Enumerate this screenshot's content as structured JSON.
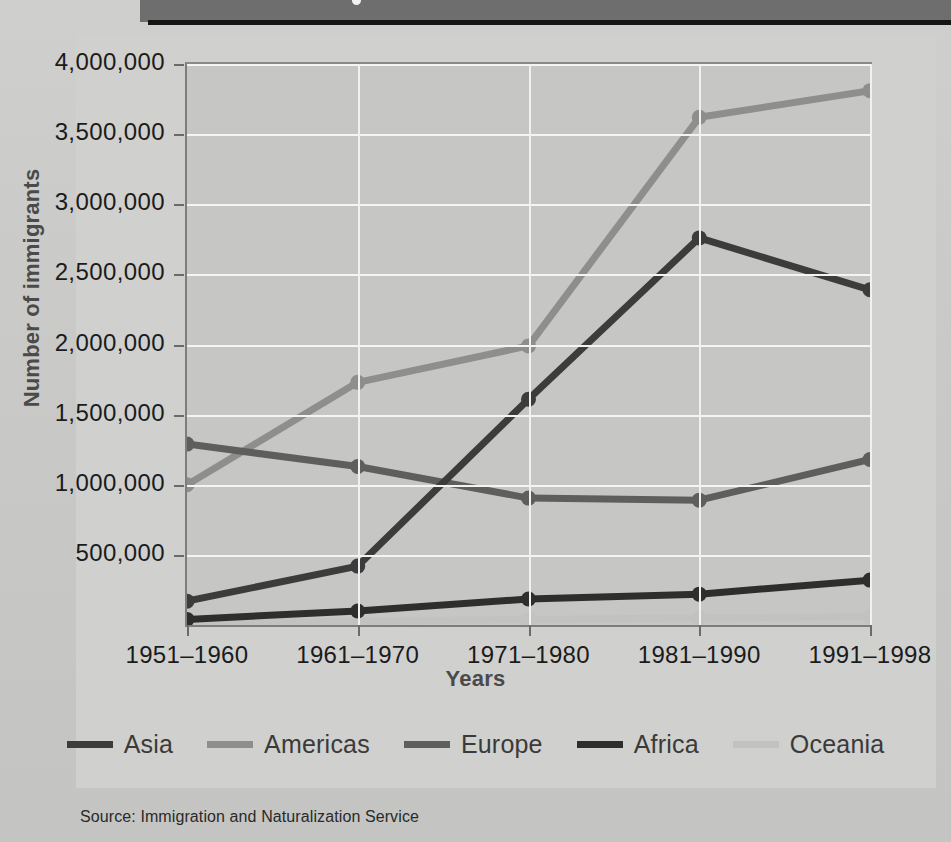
{
  "banner": {
    "title": "",
    "dot_icon": "bullet-dot-icon"
  },
  "axes": {
    "ylabel": "Number of immigrants",
    "xlabel": "Years",
    "yticks": [
      "4,000,000",
      "3,500,000",
      "3,000,000",
      "2,500,000",
      "2,000,000",
      "1,500,000",
      "1,000,000",
      "500,000"
    ],
    "xticks": [
      "1951–1960",
      "1961–1970",
      "1971–1980",
      "1981–1990",
      "1991–1998"
    ]
  },
  "legend": {
    "items": [
      {
        "label": "Asia",
        "color": "#3c3c3c"
      },
      {
        "label": "Americas",
        "color": "#8e8e8c"
      },
      {
        "label": "Europe",
        "color": "#5e5e5c"
      },
      {
        "label": "Africa",
        "color": "#2e2e2e"
      },
      {
        "label": "Oceania",
        "color": "#c2c2c0"
      }
    ]
  },
  "source": {
    "text": "Source:  Immigration and Naturalization Service"
  },
  "colors": {
    "page_background": "#c8c8c6",
    "plot_background": "#c6c6c4",
    "gridline": "#f4f4f2",
    "axis": "#6a6a68",
    "banner": "#6e6e6e",
    "banner_rule": "#151515"
  },
  "chart_data": {
    "type": "line",
    "title": "",
    "xlabel": "Years",
    "ylabel": "Number of immigrants",
    "categories": [
      "1951–1960",
      "1961–1970",
      "1971–1980",
      "1981–1990",
      "1991–1998"
    ],
    "ylim": [
      0,
      4000000
    ],
    "ytick_values": [
      500000,
      1000000,
      1500000,
      2000000,
      2500000,
      3000000,
      3500000,
      4000000
    ],
    "grid": "horizontal-and-vertical",
    "legend_position": "bottom",
    "markers": "filled-circle",
    "series": [
      {
        "name": "Asia",
        "color": "#3c3c3c",
        "values": [
          170000,
          420000,
          1610000,
          2760000,
          2390000
        ]
      },
      {
        "name": "Americas",
        "color": "#8e8e8c",
        "values": [
          1000000,
          1730000,
          1990000,
          3620000,
          3810000
        ]
      },
      {
        "name": "Europe",
        "color": "#5e5e5c",
        "values": [
          1290000,
          1130000,
          905000,
          890000,
          1180000
        ]
      },
      {
        "name": "Africa",
        "color": "#2e2e2e",
        "values": [
          40000,
          100000,
          185000,
          220000,
          320000
        ]
      },
      {
        "name": "Oceania",
        "color": "#c2c2c0",
        "values": [
          15000,
          25000,
          40000,
          50000,
          60000
        ]
      }
    ]
  }
}
